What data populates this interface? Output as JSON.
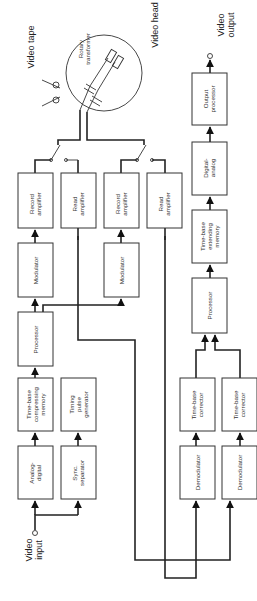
{
  "diagram": {
    "title": "",
    "orientation": "rotated-90-ccw",
    "labels": {
      "video_input": [
        "Video",
        "input"
      ],
      "video_output": [
        "Video",
        "output"
      ],
      "video_tape": "Video tape",
      "video_head": "Video head",
      "rotary_transformer": [
        "Rotary",
        "transformer"
      ]
    },
    "blocks": {
      "analog_digital": [
        "Analog-",
        "digital"
      ],
      "sync_separator": [
        "Sync.",
        "separator"
      ],
      "tb_compressing": [
        "Time-base",
        "compressing",
        "memory"
      ],
      "timing_pulse": [
        "Timing",
        "pulse",
        "generator"
      ],
      "processor_rec": [
        "Processor"
      ],
      "modulator_1": [
        "Modulator"
      ],
      "modulator_2": [
        "Modulator"
      ],
      "record_amp_1": [
        "Record",
        "amplifier"
      ],
      "record_amp_2": [
        "Record",
        "amplifier"
      ],
      "read_amp_1": [
        "Read",
        "amplifier"
      ],
      "read_amp_2": [
        "Read",
        "amplifier"
      ],
      "demodulator_1": [
        "Demodulator"
      ],
      "demodulator_2": [
        "Demodulator"
      ],
      "tb_corrector_1": [
        "Time-base",
        "corrector"
      ],
      "tb_corrector_2": [
        "Time-base",
        "corrector"
      ],
      "processor_play": [
        "Processor"
      ],
      "tb_extending": [
        "Time-base",
        "extending",
        "memory"
      ],
      "digital_analog": [
        "Digital-",
        "analog"
      ],
      "output_processor": [
        "Output",
        "processor"
      ]
    }
  }
}
